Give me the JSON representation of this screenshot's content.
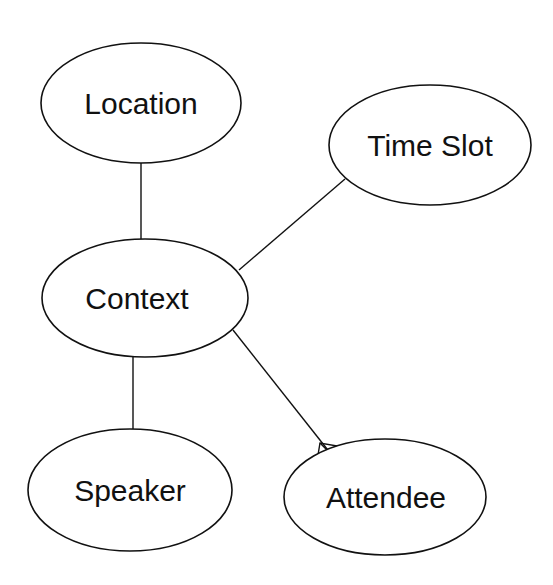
{
  "diagram": {
    "type": "entity-relationship",
    "nodes": [
      {
        "id": "location",
        "label": "Location",
        "cx": 141,
        "cy": 103,
        "rx": 100,
        "ry": 60
      },
      {
        "id": "time_slot",
        "label": "Time Slot",
        "cx": 430,
        "cy": 145,
        "rx": 101,
        "ry": 60
      },
      {
        "id": "context",
        "label": "Context",
        "cx": 145,
        "cy": 298,
        "rx": 103,
        "ry": 59
      },
      {
        "id": "speaker",
        "label": "Speaker",
        "cx": 130,
        "cy": 490,
        "rx": 102,
        "ry": 61
      },
      {
        "id": "attendee",
        "label": "Attendee",
        "cx": 385,
        "cy": 497,
        "rx": 101,
        "ry": 58
      }
    ],
    "edges": [
      {
        "from": "location",
        "to": "context",
        "cardinality": "one-to-one"
      },
      {
        "from": "context",
        "to": "time_slot",
        "cardinality": "one-to-one"
      },
      {
        "from": "context",
        "to": "speaker",
        "cardinality": "one-to-one"
      },
      {
        "from": "context",
        "to": "attendee",
        "cardinality": "one-to-many"
      }
    ],
    "colors": {
      "stroke": "#111111",
      "fill": "#ffffff",
      "background": "#ffffff"
    }
  }
}
